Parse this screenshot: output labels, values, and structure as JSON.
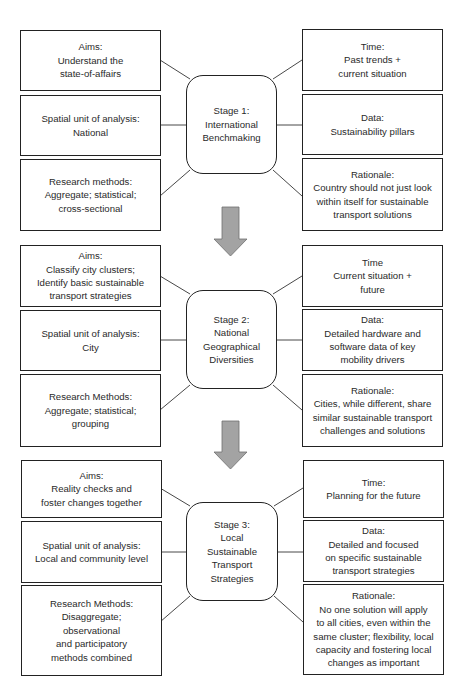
{
  "diagram": {
    "stages": [
      {
        "center": "Stage 1:\nInternational\nBenchmaking",
        "aims": "Aims:\nUnderstand the\nstate-of-affairs",
        "spatial": "Spatial unit of analysis:\nNational",
        "methods": "Research methods:\nAggregate; statistical;\ncross-sectional",
        "time": "Time:\nPast trends +\ncurrent situation",
        "data": "Data:\nSustainability pillars",
        "rationale": "Rationale:\nCountry should not just look\nwithin itself for sustainable\ntransport solutions"
      },
      {
        "center": "Stage 2:\nNational\nGeographical\nDiversities",
        "aims": "Aims:\nClassify city clusters;\nIdentify basic sustainable\ntransport strategies",
        "spatial": "Spatial unit of analysis:\nCity",
        "methods": "Research Methods:\nAggregate; statistical;\ngrouping",
        "time": "Time\nCurrent situation +\nfuture",
        "data": "Data:\nDetailed hardware and\nsoftware data of key\nmobility drivers",
        "rationale": "Rationale:\nCities, while different, share\nsimilar sustainable transport\nchallenges and solutions"
      },
      {
        "center": "Stage 3:\nLocal\nSustainable\nTransport\nStrategies",
        "aims": "Aims:\nReality checks and\nfoster changes together",
        "spatial": "Spatial unit of analysis:\nLocal and community level",
        "methods": "Research Methods:\nDisaggregate;\nobservational\nand participatory\nmethods combined",
        "time": "Time:\nPlanning for the future",
        "data": "Data:\nDetailed and focused\non specific sustainable\ntransport strategies",
        "rationale": "Rationale:\nNo one solution will apply\nto all cities, even within the\nsame cluster; flexibility, local\ncapacity and fostering local\nchanges as important"
      }
    ],
    "colors": {
      "border": "#222222",
      "arrow_fill": "#a3a3a3",
      "arrow_stroke": "#6e6e6e",
      "text": "#2a2a2a"
    }
  }
}
